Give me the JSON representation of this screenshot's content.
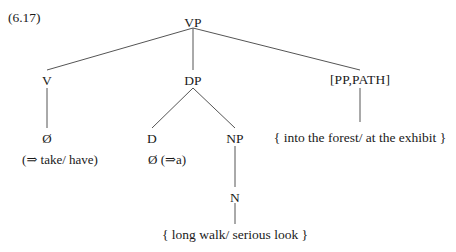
{
  "example": {
    "number": "(6.17)"
  },
  "tree": {
    "root": {
      "label": "VP"
    },
    "nodes": {
      "v": "V",
      "dp": "DP",
      "pp_path": "[PP,PATH]",
      "d": "D",
      "np": "NP",
      "n": "N"
    },
    "terminals": {
      "v_head": "Ø",
      "v_gloss": "(⇒ take/ have)",
      "d_head": "Ø (⇒a)",
      "np_content": "{ long walk/ serious look }",
      "pp_content": "{ into the forest/ at the exhibit }"
    }
  },
  "style": {
    "line_color": "#555555",
    "text_color": "#1a1a1a",
    "background": "#ffffff"
  }
}
